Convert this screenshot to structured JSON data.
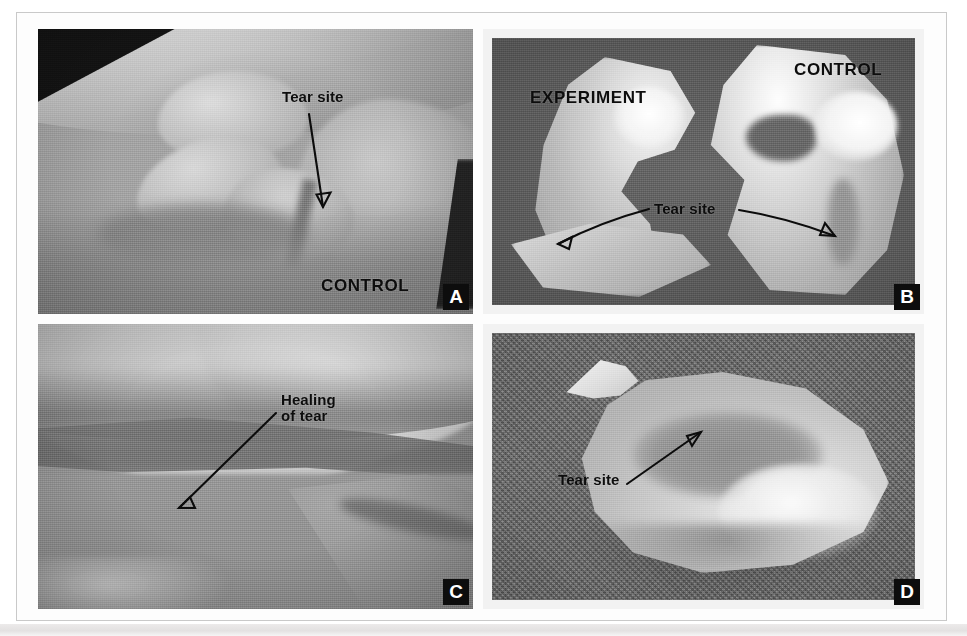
{
  "figure": {
    "panel_count": 4,
    "background_color": "#ffffff",
    "border_color": "#c9c9c9"
  },
  "panels": [
    {
      "id": "A",
      "badge": "A",
      "position": "top-left",
      "background_tone": "#9a9a9a",
      "annotations": [
        {
          "name": "tear-site",
          "text": "Tear site",
          "style": "mixed-case",
          "font_size": 15
        },
        {
          "name": "control",
          "text": "CONTROL",
          "style": "uppercase",
          "font_size": 17
        }
      ],
      "arrows": [
        {
          "name": "tear-site-arrow",
          "kind": "single",
          "direction": "down"
        }
      ]
    },
    {
      "id": "B",
      "badge": "B",
      "position": "top-right",
      "background_tone": "#5c5c5c",
      "annotations": [
        {
          "name": "experiment",
          "text": "EXPERIMENT",
          "style": "uppercase",
          "font_size": 17
        },
        {
          "name": "control",
          "text": "CONTROL",
          "style": "uppercase",
          "font_size": 17
        },
        {
          "name": "tear-site",
          "text": "Tear site",
          "style": "mixed-case",
          "font_size": 15
        }
      ],
      "arrows": [
        {
          "name": "tear-site-arrow-left",
          "kind": "single",
          "direction": "down-left"
        },
        {
          "name": "tear-site-arrow-right",
          "kind": "single",
          "direction": "down-right"
        }
      ]
    },
    {
      "id": "C",
      "badge": "C",
      "position": "bottom-left",
      "background_tone": "#949494",
      "annotations": [
        {
          "name": "healing-of-tear",
          "text": "Healing\nof tear",
          "style": "mixed-case",
          "font_size": 15
        }
      ],
      "arrows": [
        {
          "name": "healing-arrow",
          "kind": "single",
          "direction": "down-left"
        }
      ]
    },
    {
      "id": "D",
      "badge": "D",
      "position": "bottom-right",
      "background_tone": "#696969",
      "annotations": [
        {
          "name": "tear-site",
          "text": "Tear site",
          "style": "mixed-case",
          "font_size": 15
        }
      ],
      "arrows": [
        {
          "name": "tear-site-arrow",
          "kind": "single",
          "direction": "up-right"
        }
      ]
    }
  ],
  "labels": {
    "tear_site": "Tear site",
    "control": "CONTROL",
    "experiment": "EXPERIMENT",
    "healing_of_tear_line1": "Healing",
    "healing_of_tear_line2": "of tear",
    "badge_a": "A",
    "badge_b": "B",
    "badge_c": "C",
    "badge_d": "D"
  }
}
